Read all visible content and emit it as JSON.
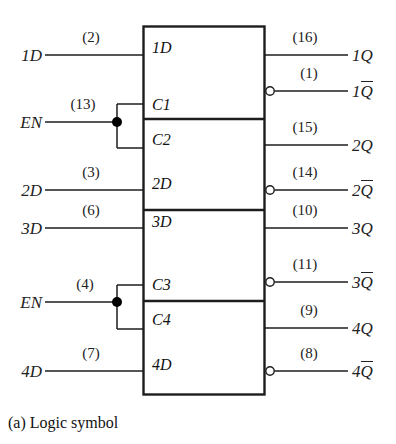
{
  "figure": {
    "caption": "(a) Logic symbol",
    "device_type": "quad D latch logic symbol",
    "box": {
      "x": 143,
      "y": 26,
      "width": 122,
      "height": 369
    },
    "section_dividers_y": [
      119,
      210,
      301
    ]
  },
  "inputs": [
    {
      "name": "1D",
      "signal": "1D",
      "pin": "(2)",
      "y": 55,
      "box_label": "1D",
      "box_label_y": 48,
      "type": "data",
      "branch": false
    },
    {
      "name": "EN1",
      "signal": "EN",
      "pin": "(13)",
      "y": 122,
      "box_label": "C1",
      "box_label_y": 105,
      "type": "enable",
      "branch": true,
      "branch_targets": [
        "C1",
        "C2"
      ],
      "branch_top_y": 104,
      "branch_bottom_y": 148
    },
    {
      "name": "C2",
      "signal": "",
      "pin": "",
      "y": 0,
      "box_label": "C2",
      "box_label_y": 140,
      "type": "clock-internal",
      "branch": false
    },
    {
      "name": "2D",
      "signal": "2D",
      "pin": "(3)",
      "y": 190,
      "box_label": "2D",
      "box_label_y": 184,
      "type": "data",
      "branch": false
    },
    {
      "name": "3D",
      "signal": "3D",
      "pin": "(6)",
      "y": 228,
      "box_label": "3D",
      "box_label_y": 222,
      "type": "data",
      "branch": false
    },
    {
      "name": "EN2",
      "signal": "EN",
      "pin": "(4)",
      "y": 302,
      "box_label": "C3",
      "box_label_y": 285,
      "type": "enable",
      "branch": true,
      "branch_targets": [
        "C3",
        "C4"
      ],
      "branch_top_y": 285,
      "branch_bottom_y": 329
    },
    {
      "name": "C4",
      "signal": "",
      "pin": "",
      "y": 0,
      "box_label": "C4",
      "box_label_y": 320,
      "type": "clock-internal",
      "branch": false
    },
    {
      "name": "4D",
      "signal": "4D",
      "pin": "(7)",
      "y": 371,
      "box_label": "4D",
      "box_label_y": 365,
      "type": "data",
      "branch": false
    }
  ],
  "outputs": [
    {
      "name": "1Q",
      "base": "1",
      "letter": "Q",
      "pin": "(16)",
      "y": 55,
      "inverted": false
    },
    {
      "name": "1Qbar",
      "base": "1",
      "letter": "Q",
      "pin": "(1)",
      "y": 91,
      "inverted": true
    },
    {
      "name": "2Q",
      "base": "2",
      "letter": "Q",
      "pin": "(15)",
      "y": 145,
      "inverted": false
    },
    {
      "name": "2Qbar",
      "base": "2",
      "letter": "Q",
      "pin": "(14)",
      "y": 190,
      "inverted": true
    },
    {
      "name": "3Q",
      "base": "3",
      "letter": "Q",
      "pin": "(10)",
      "y": 228,
      "inverted": false
    },
    {
      "name": "3Qbar",
      "base": "3",
      "letter": "Q",
      "pin": "(11)",
      "y": 282,
      "inverted": true
    },
    {
      "name": "4Q",
      "base": "4",
      "letter": "Q",
      "pin": "(9)",
      "y": 328,
      "inverted": false
    },
    {
      "name": "4Qbar",
      "base": "4",
      "letter": "Q",
      "pin": "(8)",
      "y": 371,
      "inverted": true
    }
  ],
  "geometry": {
    "input_line_start_x": 45,
    "input_line_end_x": 143,
    "branch_dot_x": 117,
    "branch_stub_x": 137,
    "output_line_start_x": 265,
    "output_line_end_x": 348,
    "bubble_radius": 4,
    "bubble_cx": 270,
    "left_label_x": 8,
    "right_label_x": 352
  },
  "colors": {
    "stroke": "#1d1d1d",
    "text": "#1a1a1a",
    "background": "#ffffff",
    "dot_fill": "#000000",
    "bubble_fill": "#ffffff"
  }
}
